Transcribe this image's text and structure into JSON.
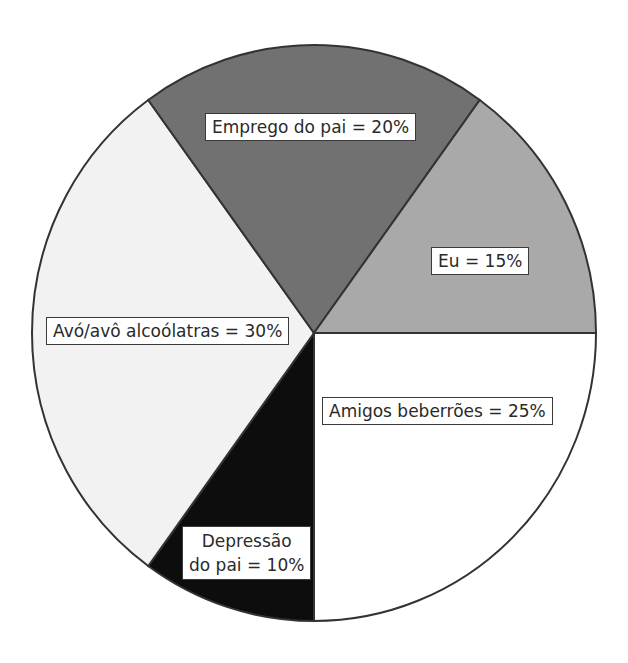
{
  "chart_data": {
    "type": "pie",
    "title": "",
    "start_angle_deg": 0,
    "direction": "clockwise",
    "slices": [
      {
        "label": "Amigos beberrões",
        "value": 25,
        "text": "Amigos beberrões = 25%",
        "color": "#ffffff"
      },
      {
        "label": "Depressão do pai",
        "value": 10,
        "text_line1": "Depressão",
        "text_line2": "do pai = 10%",
        "color": "#0d0d0d"
      },
      {
        "label": "Avó/avô alcoólatras",
        "value": 30,
        "text": "Avó/avô alcoólatras = 30%",
        "color": "#f2f2f2"
      },
      {
        "label": "Emprego do pai",
        "value": 20,
        "text": "Emprego do pai = 20%",
        "color": "#717171"
      },
      {
        "label": "Eu",
        "value": 15,
        "text": "Eu = 15%",
        "color": "#a9a9a9"
      }
    ],
    "legend": "none",
    "stroke_color": "#333333"
  }
}
